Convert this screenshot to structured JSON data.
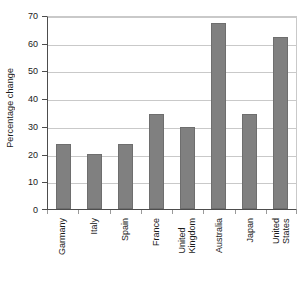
{
  "chart_data": {
    "type": "bar",
    "title": "",
    "xlabel": "",
    "ylabel": "Percentage change",
    "ylim": [
      0,
      70
    ],
    "ytick_step": 10,
    "yticks": [
      0,
      10,
      20,
      30,
      40,
      50,
      60,
      70
    ],
    "ytick_labels": [
      "0",
      "10",
      "20",
      "30",
      "40",
      "50",
      "60",
      "70"
    ],
    "grid": true,
    "legend": false,
    "categories": [
      "Garmany",
      "Italy",
      "Spain",
      "France",
      "United\nKingdom",
      "Australia",
      "Japan",
      "United\nStates"
    ],
    "values": [
      23.5,
      19.7,
      23.5,
      34.3,
      29.7,
      67.2,
      34.3,
      62.2
    ],
    "series": [
      {
        "name": "Percentage change",
        "values": [
          23.5,
          19.7,
          23.5,
          34.3,
          29.7,
          67.2,
          34.3,
          62.2
        ]
      }
    ],
    "colors": {
      "bar_fill": "#808080",
      "bar_edge": "#6e6e6e",
      "gridline": "#c9c9c9",
      "axis": "#4d4d4d",
      "text": "#1a1a1a",
      "background": "#ffffff"
    }
  }
}
